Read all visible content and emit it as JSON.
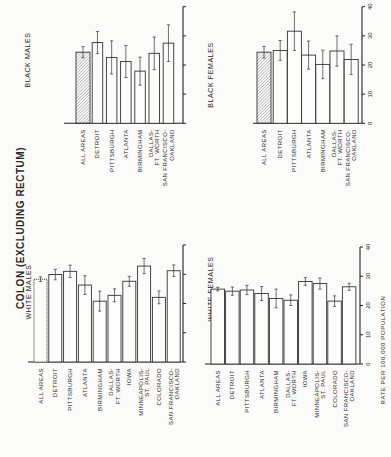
{
  "title": "COLON (EXCLUDING RECTUM)",
  "axis_label": "RATE PER 100,000 POPULATION",
  "axis_ticks": [
    "0",
    "10",
    "20",
    "30",
    "40"
  ],
  "chart_data": [
    {
      "type": "bar",
      "title": "BLACK MALES",
      "ylabel": "RATE PER 100,000 POPULATION",
      "ylim": [
        0,
        40
      ],
      "categories": [
        "ALL AREAS",
        "DETROIT",
        "PITTSBURGH",
        "ATLANTA",
        "BIRMINGHAM",
        "DALLAS-FT. WORTH",
        "SAN FRANCISCO-OAKLAND"
      ],
      "values": [
        24.4,
        27.7,
        22.6,
        21.2,
        17.9,
        24.0,
        27.5
      ],
      "error": [
        1.9,
        3.8,
        5.7,
        5.5,
        4.8,
        5.6,
        6.3
      ],
      "hatched_first": true
    },
    {
      "type": "bar",
      "title": "BLACK FEMALES",
      "ylabel": "RATE PER 100,000 POPULATION",
      "ylim": [
        0,
        40
      ],
      "categories": [
        "ALL AREAS",
        "DETROIT",
        "PITTSBURGH",
        "ATLANTA",
        "BIRMINGHAM",
        "DALLAS-FT. WORTH",
        "SAN FRANCISCO-OAKLAND"
      ],
      "values": [
        24.4,
        25.0,
        31.6,
        23.4,
        20.2,
        24.8,
        21.9
      ],
      "error": [
        2.0,
        3.4,
        6.6,
        4.8,
        4.9,
        5.2,
        5.2
      ],
      "hatched_first": true
    },
    {
      "type": "bar",
      "title": "WHITE MALES",
      "ylabel": "RATE PER 100,000 POPULATION",
      "ylim": [
        0,
        40
      ],
      "categories": [
        "ALL AREAS",
        "DETROIT",
        "PITTSBURGH",
        "ATLANTA",
        "BIRMINGHAM",
        "DALLAS-FT. WORTH",
        "IOWA",
        "MINNEAPOLIS-ST. PAUL",
        "COLORADO",
        "SAN FRANCISCO-OAKLAND"
      ],
      "values": [
        28.3,
        29.9,
        31.0,
        26.3,
        20.8,
        22.8,
        27.6,
        32.8,
        22.1,
        31.2
      ],
      "error": [
        0.8,
        1.8,
        2.1,
        3.2,
        3.4,
        2.2,
        1.7,
        2.6,
        2.2,
        2.0
      ],
      "hatched_first": false
    },
    {
      "type": "bar",
      "title": "WHITE FEMALES",
      "ylabel": "RATE PER 100,000 POPULATION",
      "ylim": [
        0,
        40
      ],
      "categories": [
        "ALL AREAS",
        "DETROIT",
        "PITTSBURGH",
        "ATLANTA",
        "BIRMINGHAM",
        "DALLAS-FT. WORTH",
        "IOWA",
        "MINNEAPOLIS-ST. PAUL",
        "COLORADO",
        "SAN FRANCISCO-OAKLAND"
      ],
      "values": [
        25.6,
        24.9,
        25.3,
        24.1,
        22.4,
        21.8,
        28.2,
        27.5,
        21.5,
        26.4
      ],
      "error": [
        0.6,
        1.4,
        1.6,
        2.4,
        3.2,
        1.8,
        1.3,
        1.9,
        1.8,
        1.2
      ],
      "hatched_first": false
    }
  ],
  "label_lines": {
    "ALL AREAS": [
      "ALL AREAS"
    ],
    "DETROIT": [
      "DETROIT"
    ],
    "PITTSBURGH": [
      "PITTSBURGH"
    ],
    "ATLANTA": [
      "ATLANTA"
    ],
    "BIRMINGHAM": [
      "BIRMINGHAM"
    ],
    "DALLAS-FT. WORTH": [
      "DALLAS-",
      "FT. WORTH"
    ],
    "IOWA": [
      "IOWA"
    ],
    "MINNEAPOLIS-ST. PAUL": [
      "MINNEAPOLIS-",
      "ST. PAUL"
    ],
    "COLORADO": [
      "COLORADO"
    ],
    "SAN FRANCISCO-OAKLAND": [
      "SAN FRANCISCO-",
      "OAKLAND"
    ]
  }
}
